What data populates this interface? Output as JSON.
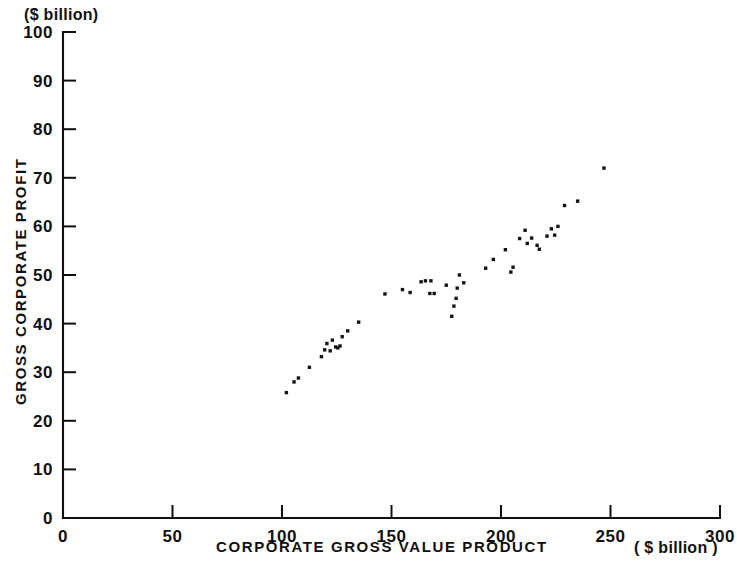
{
  "chart_data": {
    "type": "scatter",
    "title": "",
    "xlabel": "CORPORATE  GROSS  VALUE  PRODUCT",
    "ylabel": "GROSS  CORPORATE  PROFIT",
    "x_unit_label": "( $ billion )",
    "y_unit_label": "($ billion)",
    "xlim": [
      0,
      300
    ],
    "ylim": [
      0,
      100
    ],
    "xticks": [
      0,
      50,
      100,
      150,
      200,
      250,
      300
    ],
    "yticks": [
      0,
      10,
      20,
      30,
      40,
      50,
      60,
      70,
      80,
      90,
      100
    ],
    "xtick_labels": [
      "0",
      "50",
      "100",
      "150",
      "200",
      "250",
      "300"
    ],
    "ytick_labels": [
      "0",
      "10",
      "20",
      "30",
      "40",
      "50",
      "60",
      "70",
      "80",
      "90",
      "100"
    ],
    "grid": false,
    "legend": null,
    "marker": "square-dot",
    "marker_color": "#151515",
    "marker_size_px": 3.4,
    "n_points": 57,
    "points": [
      [
        102.0,
        25.8
      ],
      [
        105.5,
        28.0
      ],
      [
        107.5,
        28.8
      ],
      [
        112.5,
        31.0
      ],
      [
        118.0,
        33.2
      ],
      [
        119.5,
        34.6
      ],
      [
        120.5,
        35.9
      ],
      [
        122.0,
        34.4
      ],
      [
        123.0,
        36.6
      ],
      [
        124.5,
        35.2
      ],
      [
        125.5,
        35.0
      ],
      [
        126.5,
        35.4
      ],
      [
        127.5,
        37.3
      ],
      [
        130.0,
        38.5
      ],
      [
        135.0,
        40.3
      ],
      [
        147.0,
        46.1
      ],
      [
        155.0,
        47.0
      ],
      [
        158.5,
        46.4
      ],
      [
        163.5,
        48.6
      ],
      [
        165.5,
        48.8
      ],
      [
        168.0,
        48.8
      ],
      [
        167.5,
        46.2
      ],
      [
        169.5,
        46.2
      ],
      [
        175.0,
        47.9
      ],
      [
        177.5,
        41.5
      ],
      [
        178.5,
        43.6
      ],
      [
        179.5,
        45.2
      ],
      [
        180.0,
        47.3
      ],
      [
        181.0,
        50.0
      ],
      [
        183.0,
        48.4
      ],
      [
        193.0,
        51.4
      ],
      [
        196.5,
        53.2
      ],
      [
        202.0,
        55.2
      ],
      [
        204.5,
        50.6
      ],
      [
        205.5,
        51.6
      ],
      [
        208.5,
        57.5
      ],
      [
        211.0,
        59.2
      ],
      [
        212.0,
        56.5
      ],
      [
        214.0,
        57.6
      ],
      [
        216.5,
        56.1
      ],
      [
        217.5,
        55.3
      ],
      [
        221.0,
        58.0
      ],
      [
        223.0,
        59.5
      ],
      [
        224.5,
        58.2
      ],
      [
        226.0,
        60.0
      ],
      [
        229.0,
        64.3
      ],
      [
        235.0,
        65.2
      ],
      [
        247.0,
        72.0
      ]
    ]
  }
}
